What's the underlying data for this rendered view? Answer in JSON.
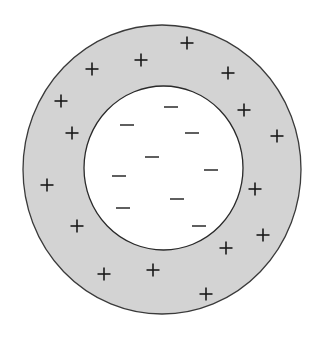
{
  "diagram": {
    "type": "concentric-charge-distribution",
    "outer_shell": {
      "label": "positively charged outer shell",
      "cx": 162,
      "cy": 169.5,
      "rx": 139,
      "ry": 144.5,
      "fill": "#d3d3d3",
      "stroke": "#3a3a3a"
    },
    "inner_region": {
      "label": "negatively charged inner region",
      "cx": 163.5,
      "cy": 168,
      "rx": 79.5,
      "ry": 82,
      "fill": "#ffffff",
      "stroke": "#2a2a2a"
    },
    "plus_charges": [
      {
        "x": 187,
        "y": 43
      },
      {
        "x": 141,
        "y": 60
      },
      {
        "x": 92,
        "y": 69
      },
      {
        "x": 228,
        "y": 73
      },
      {
        "x": 61,
        "y": 101
      },
      {
        "x": 244,
        "y": 110
      },
      {
        "x": 72,
        "y": 133
      },
      {
        "x": 277,
        "y": 136
      },
      {
        "x": 47,
        "y": 185
      },
      {
        "x": 255,
        "y": 189
      },
      {
        "x": 77,
        "y": 226
      },
      {
        "x": 263,
        "y": 235
      },
      {
        "x": 226,
        "y": 248
      },
      {
        "x": 153,
        "y": 270
      },
      {
        "x": 104,
        "y": 274
      },
      {
        "x": 206,
        "y": 294
      }
    ],
    "minus_charges": [
      {
        "x": 171,
        "y": 107
      },
      {
        "x": 127,
        "y": 125
      },
      {
        "x": 192,
        "y": 133
      },
      {
        "x": 152,
        "y": 157
      },
      {
        "x": 211,
        "y": 170
      },
      {
        "x": 119,
        "y": 176
      },
      {
        "x": 177,
        "y": 199
      },
      {
        "x": 123,
        "y": 208
      },
      {
        "x": 199,
        "y": 226
      }
    ],
    "symbol_color": "#1a1a1a",
    "plus_count": 16,
    "minus_count": 9
  }
}
